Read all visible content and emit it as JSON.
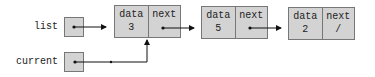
{
  "variables": [
    {
      "name": "list",
      "points_to": "node-1"
    },
    {
      "name": "current",
      "points_to": "node-1"
    }
  ],
  "nodes": [
    {
      "id": "node-1",
      "data_label": "data",
      "next_label": "next",
      "data": "3",
      "next": ""
    },
    {
      "id": "node-2",
      "data_label": "data",
      "next_label": "next",
      "data": "5",
      "next": ""
    },
    {
      "id": "node-3",
      "data_label": "data",
      "next_label": "next",
      "data": "2",
      "next": "/"
    }
  ],
  "colors": {
    "fill": "#d3d3d3",
    "border": "#777777",
    "line": "#111111"
  }
}
